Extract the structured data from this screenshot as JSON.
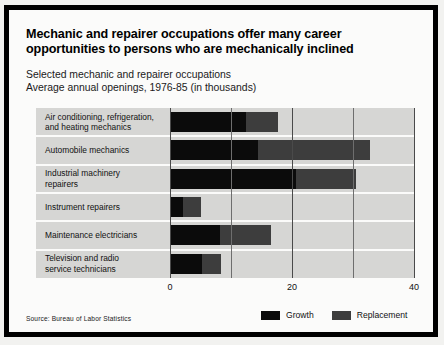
{
  "title": "Mechanic and repairer occupations offer many career opportunities to persons who are mechanically inclined",
  "subtitle_line1": "Selected mechanic and repairer occupations",
  "subtitle_line2": "Average annual openings, 1976-85 (in thousands)",
  "source": "Source: Bureau of Labor Statistics",
  "legend": {
    "growth_label": "Growth",
    "replacement_label": "Replacement",
    "growth_color": "#0b0b0b",
    "replacement_color": "#3d3d3d"
  },
  "chart_data": {
    "type": "bar",
    "orientation": "horizontal",
    "stacked": true,
    "title": "Mechanic and repairer occupations offer many career opportunities to persons who are mechanically inclined",
    "subtitle": "Selected mechanic and repairer occupations. Average annual openings, 1976-85 (in thousands)",
    "xlabel": "",
    "ylabel": "",
    "xlim": [
      0,
      40
    ],
    "xticks": [
      0,
      20,
      40
    ],
    "xticklabels": [
      "0",
      "20",
      "40"
    ],
    "minor_gridlines": [
      10,
      30
    ],
    "grid": true,
    "legend_position": "bottom-right",
    "plot_background": "#d6d6d4",
    "categories": [
      "Air conditioning, refrigeration,\nand heating mechanics",
      "Automobile mechanics",
      "Industrial machinery\nrepairers",
      "Instrument repairers",
      "Maintenance electricians",
      "Television and radio\nservice technicians"
    ],
    "series": [
      {
        "name": "Growth",
        "color": "#0b0b0b",
        "values": [
          12.5,
          14.4,
          20.6,
          2.1,
          8.2,
          5.2
        ]
      },
      {
        "name": "Replacement",
        "color": "#3d3d3d",
        "values": [
          5.2,
          18.4,
          9.9,
          3.0,
          8.3,
          3.2
        ]
      }
    ],
    "totals": [
      17.7,
      32.8,
      30.5,
      5.1,
      16.5,
      8.4
    ]
  }
}
